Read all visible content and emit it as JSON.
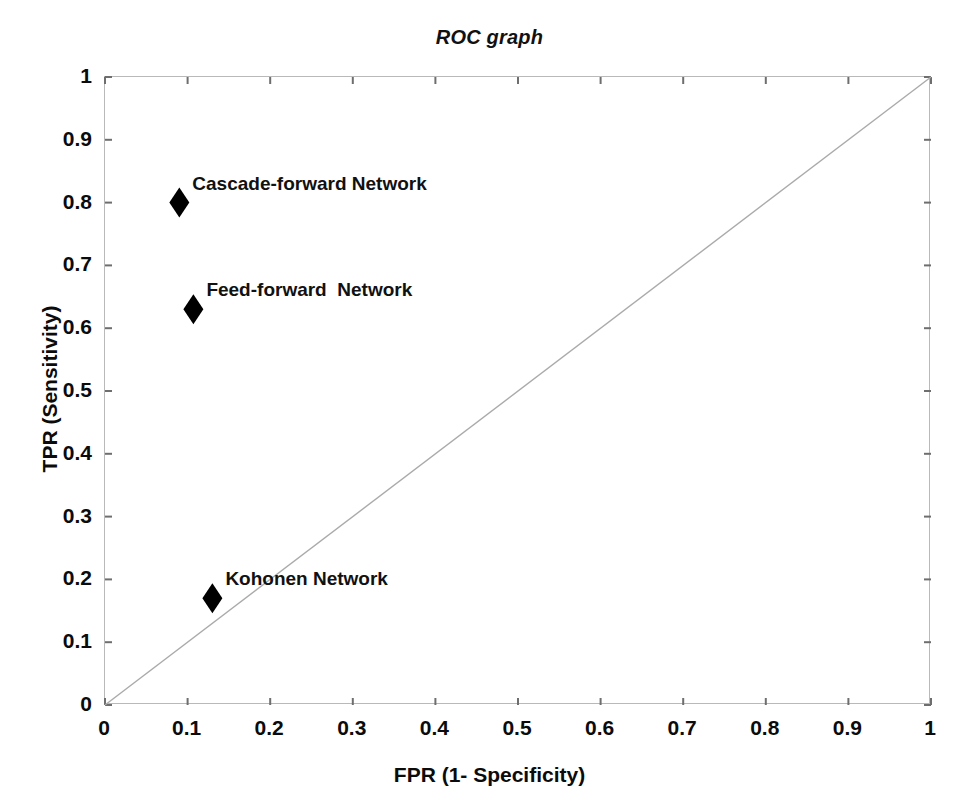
{
  "chart_data": {
    "type": "scatter",
    "title": "ROC graph",
    "xlabel": "FPR (1- Specificity)",
    "ylabel": "TPR (Sensitivity)",
    "xlim": [
      0,
      1
    ],
    "ylim": [
      0,
      1
    ],
    "grid": false,
    "legend": "none (points labeled inline)",
    "xticks": [
      "0",
      "0.1",
      "0.2",
      "0.3",
      "0.4",
      "0.5",
      "0.6",
      "0.7",
      "0.8",
      "0.9",
      "1"
    ],
    "xtick_values": [
      0,
      0.1,
      0.2,
      0.3,
      0.4,
      0.5,
      0.6,
      0.7,
      0.8,
      0.9,
      1
    ],
    "yticks": [
      "0",
      "0.1",
      "0.2",
      "0.3",
      "0.4",
      "0.5",
      "0.6",
      "0.7",
      "0.8",
      "0.9",
      "1"
    ],
    "ytick_values": [
      0,
      0.1,
      0.2,
      0.3,
      0.4,
      0.5,
      0.6,
      0.7,
      0.8,
      0.9,
      1
    ],
    "marker": "diamond",
    "marker_color": "#000000",
    "reference_line": {
      "name": "chance-diagonal",
      "from": [
        0,
        0
      ],
      "to": [
        1,
        1
      ],
      "color": "#aaaaaa"
    },
    "points": [
      {
        "label": "Cascade-forward Network",
        "x": 0.09,
        "y": 0.8
      },
      {
        "label": "Feed-forward  Network",
        "x": 0.107,
        "y": 0.63
      },
      {
        "label": "Kohonen Network",
        "x": 0.13,
        "y": 0.17
      }
    ]
  },
  "axis_colors": {
    "frame": "#b9b9b9",
    "tick": "#6e6e6e",
    "text": "#0b0b0b"
  }
}
